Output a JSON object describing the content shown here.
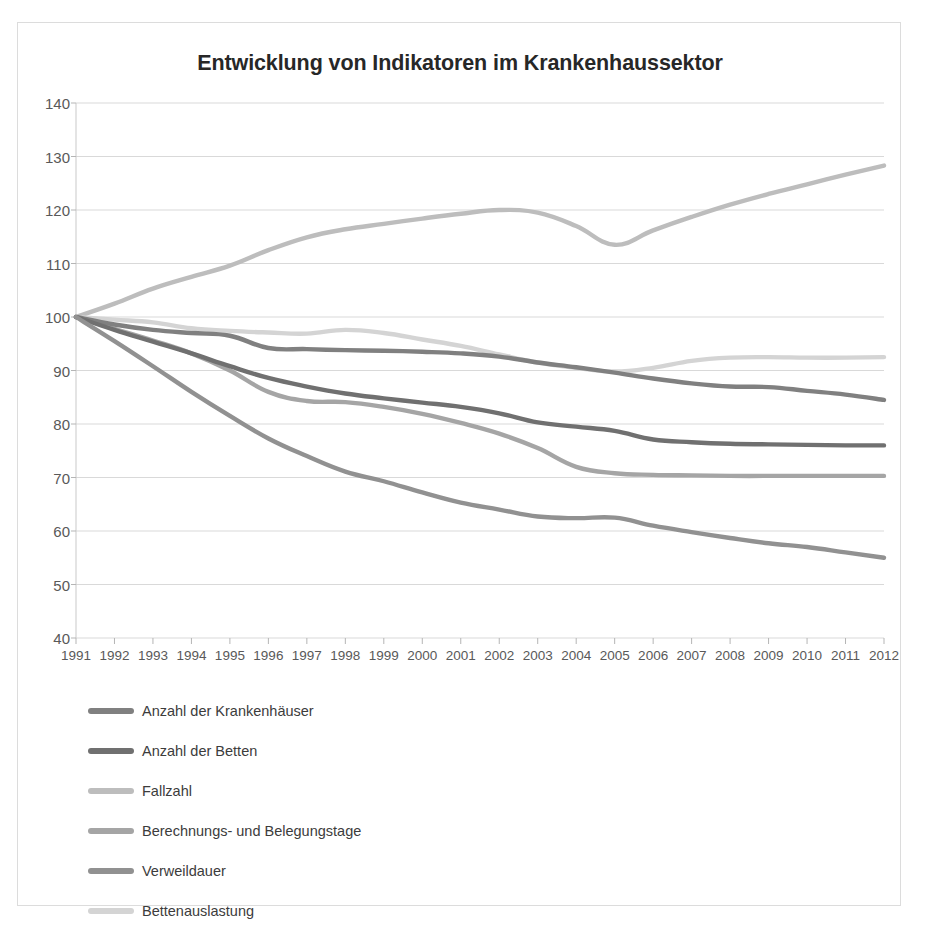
{
  "chart_data": {
    "type": "line",
    "title": "Entwicklung von Indikatoren im Krankenhaussektor",
    "xlabel": "",
    "ylabel": "",
    "ylim": [
      40,
      140
    ],
    "yticks": [
      40,
      50,
      60,
      70,
      80,
      90,
      100,
      110,
      120,
      130,
      140
    ],
    "grid": true,
    "legend_position": "below-left",
    "x": [
      1991,
      1992,
      1993,
      1994,
      1995,
      1996,
      1997,
      1998,
      1999,
      2000,
      2001,
      2002,
      2003,
      2004,
      2005,
      2006,
      2007,
      2008,
      2009,
      2010,
      2011,
      2012
    ],
    "categories": [
      "1991",
      "1992",
      "1993",
      "1994",
      "1995",
      "1996",
      "1997",
      "1998",
      "1999",
      "2000",
      "2001",
      "2002",
      "2003",
      "2004",
      "2005",
      "2006",
      "2007",
      "2008",
      "2009",
      "2010",
      "2011",
      "2012"
    ],
    "series": [
      {
        "name": "Anzahl der Krankenhäuser",
        "color": "#808080",
        "width": 4.4,
        "values": [
          100,
          98.6,
          97.6,
          97.0,
          96.5,
          94.2,
          94.0,
          93.8,
          93.7,
          93.5,
          93.2,
          92.6,
          91.5,
          90.6,
          89.6,
          88.5,
          87.6,
          87.0,
          86.9,
          86.2,
          85.5,
          84.5
        ]
      },
      {
        "name": "Anzahl der Betten",
        "color": "#707070",
        "width": 4.4,
        "values": [
          100,
          97.6,
          95.4,
          93.2,
          90.8,
          88.6,
          87.0,
          85.7,
          84.8,
          84.0,
          83.2,
          82.0,
          80.3,
          79.5,
          78.7,
          77.1,
          76.6,
          76.3,
          76.2,
          76.1,
          76.0,
          76.0
        ]
      },
      {
        "name": "Fallzahl",
        "color": "#bdbdbd",
        "width": 4.4,
        "values": [
          100,
          102.5,
          105.3,
          107.5,
          109.6,
          112.5,
          114.9,
          116.4,
          117.4,
          118.4,
          119.3,
          120.0,
          119.5,
          117.0,
          113.5,
          116.2,
          118.7,
          121.0,
          123.0,
          124.8,
          126.6,
          128.3
        ]
      },
      {
        "name": "Berechnungs- und Belegungstage",
        "color": "#a5a5a5",
        "width": 4.4,
        "values": [
          100,
          97.8,
          95.6,
          93.2,
          90.0,
          86.0,
          84.3,
          84.1,
          83.2,
          81.9,
          80.2,
          78.2,
          75.5,
          72.0,
          70.8,
          70.5,
          70.4,
          70.3,
          70.3,
          70.3,
          70.3,
          70.3
        ]
      },
      {
        "name": "Verweildauer",
        "color": "#919191",
        "width": 4.4,
        "values": [
          100,
          95.5,
          90.8,
          86.0,
          81.5,
          77.3,
          74.0,
          71.1,
          69.3,
          67.2,
          65.3,
          64.0,
          62.7,
          62.4,
          62.5,
          61.0,
          59.8,
          58.7,
          57.7,
          57.0,
          56.0,
          55.0
        ]
      },
      {
        "name": "Bettenauslastung",
        "color": "#d4d4d4",
        "width": 4.4,
        "values": [
          100,
          99.5,
          99.0,
          97.9,
          97.4,
          97.1,
          96.9,
          97.6,
          97.0,
          95.8,
          94.6,
          93.0,
          91.5,
          90.5,
          89.8,
          90.5,
          91.8,
          92.4,
          92.5,
          92.4,
          92.4,
          92.5
        ]
      }
    ]
  },
  "legend": {
    "items": [
      {
        "label": "Anzahl der Krankenhäuser",
        "color": "#808080"
      },
      {
        "label": "Anzahl der Betten",
        "color": "#707070"
      },
      {
        "label": "Fallzahl",
        "color": "#bdbdbd"
      },
      {
        "label": "Berechnungs- und Belegungstage",
        "color": "#a5a5a5"
      },
      {
        "label": "Verweildauer",
        "color": "#919191"
      },
      {
        "label": "Bettenauslastung",
        "color": "#d4d4d4"
      }
    ]
  },
  "axis": {
    "y_labels": [
      "140",
      "130",
      "120",
      "110",
      "100",
      "90",
      "80",
      "70",
      "60",
      "50",
      "40"
    ],
    "x_labels": [
      "1991",
      "1992",
      "1993",
      "1994",
      "1995",
      "1996",
      "1997",
      "1998",
      "1999",
      "2000",
      "2001",
      "2002",
      "2003",
      "2004",
      "2005",
      "2006",
      "2007",
      "2008",
      "2009",
      "2010",
      "2011",
      "2012"
    ]
  },
  "colors": {
    "grid": "#d9d9d9",
    "axis_text": "#595959",
    "title_text": "#272727",
    "frame": "#dcdcdc",
    "background": "#ffffff"
  }
}
